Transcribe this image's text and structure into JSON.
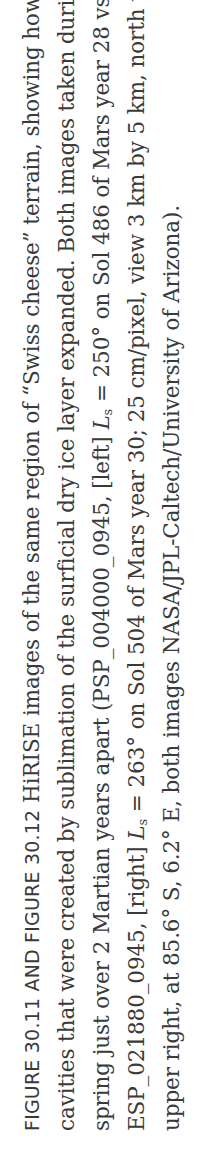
{
  "caption": {
    "label": "FIGURE 30.11 AND FIGURE 30.12",
    "lines": [
      "HiRISE images of the same region of “Swiss cheese” terrain, showing how",
      "cavities that were created by sublimation of the surficial dry ice layer expanded. Both images taken during southern",
      "spring just over 2 Martian years apart (PSP_004000_0945, [left] ",
      "ESP_021880_0945, [right] ",
      "upper right, at 85.6° S, 6.2° E, both images NASA/JPL-Caltech/University of Arizona)."
    ],
    "line3_ls_sym": "L",
    "line3_ls_sub": "s",
    "line3_rest": " = 250° on Sol 486 of Mars year 28 vs.",
    "line4_ls_sym": "L",
    "line4_ls_sub": "s",
    "line4_rest": " = 263° on Sol 504 of Mars year 30; 25 cm/pixel, view 3 km by 5 km, north to"
  }
}
